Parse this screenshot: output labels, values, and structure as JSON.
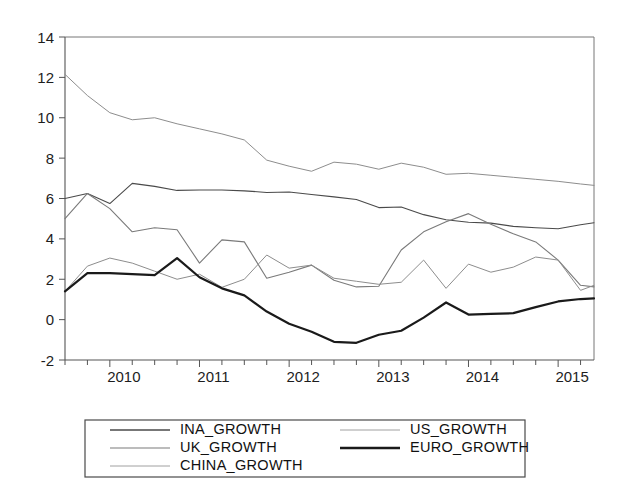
{
  "chart_data": {
    "type": "line",
    "title": "",
    "subtitle": "",
    "xlabel": "",
    "ylabel": "",
    "xlim": [
      2009.5,
      2015.4
    ],
    "ylim": [
      -2,
      14
    ],
    "y_ticks": [
      -2,
      0,
      2,
      4,
      6,
      8,
      10,
      12,
      14
    ],
    "y_tick_labels": [
      "-2",
      "0",
      "2",
      "4",
      "6",
      "8",
      "10",
      "12",
      "14"
    ],
    "x_ticks": [
      2010,
      2011,
      2012,
      2013,
      2014,
      2015
    ],
    "x_tick_labels": [
      "2010",
      "2011",
      "2012",
      "2013",
      "2014",
      "2015"
    ],
    "x_minor_tick_interval": 0.25,
    "grid": false,
    "legend_position": "bottom-center",
    "legend_columns": 2,
    "x": [
      2009.5,
      2009.75,
      2010.0,
      2010.25,
      2010.5,
      2010.75,
      2011.0,
      2011.25,
      2011.5,
      2011.75,
      2012.0,
      2012.25,
      2012.5,
      2012.75,
      2013.0,
      2013.25,
      2013.5,
      2013.75,
      2014.0,
      2014.25,
      2014.5,
      2014.75,
      2015.0,
      2015.25,
      2015.4
    ],
    "series": [
      {
        "name": "INA_GROWTH",
        "color": "#4a4a4a",
        "width": 1.1,
        "values": [
          6.0,
          6.25,
          5.75,
          6.75,
          6.6,
          6.4,
          6.42,
          6.42,
          6.38,
          6.3,
          6.32,
          6.2,
          6.08,
          5.95,
          5.55,
          5.58,
          5.2,
          4.95,
          4.82,
          4.78,
          4.62,
          4.55,
          4.5,
          4.7,
          4.8
        ]
      },
      {
        "name": "UK_GROWTH",
        "color": "#7a7a7a",
        "width": 1.1,
        "values": [
          5.0,
          6.25,
          5.5,
          4.35,
          4.55,
          4.45,
          2.8,
          3.95,
          3.85,
          2.05,
          2.35,
          2.7,
          1.95,
          1.62,
          1.65,
          3.45,
          4.35,
          4.85,
          5.25,
          4.72,
          4.25,
          3.85,
          2.95,
          1.7,
          1.62
        ]
      },
      {
        "name": "CHINA_GROWTH",
        "color": "#8d8d8d",
        "width": 1.0,
        "values": [
          12.15,
          11.1,
          10.25,
          9.9,
          10.0,
          9.7,
          9.45,
          9.2,
          8.9,
          7.9,
          7.6,
          7.35,
          7.8,
          7.7,
          7.45,
          7.75,
          7.55,
          7.2,
          7.25,
          7.15,
          7.05,
          6.95,
          6.85,
          6.72,
          6.65
        ]
      },
      {
        "name": "US_GROWTH",
        "color": "#8d8d8d",
        "width": 1.0,
        "values": [
          1.4,
          2.65,
          3.05,
          2.8,
          2.4,
          2.0,
          2.25,
          1.6,
          2.0,
          3.2,
          2.55,
          2.7,
          2.05,
          1.9,
          1.75,
          1.85,
          2.95,
          1.55,
          2.75,
          2.35,
          2.6,
          3.1,
          2.95,
          1.45,
          1.7
        ]
      },
      {
        "name": "EURO_GROWTH",
        "color": "#1a1a1a",
        "width": 2.2,
        "values": [
          1.4,
          2.3,
          2.3,
          2.25,
          2.2,
          3.05,
          2.1,
          1.55,
          1.2,
          0.4,
          -0.2,
          -0.6,
          -1.1,
          -1.15,
          -0.75,
          -0.55,
          0.1,
          0.85,
          0.25,
          0.28,
          0.32,
          0.62,
          0.9,
          1.02,
          1.05
        ]
      }
    ]
  },
  "legend": {
    "entries": [
      {
        "label": "INA_GROWTH",
        "color": "#4a4a4a",
        "width": 1.4,
        "column": 0,
        "row": 0
      },
      {
        "label": "UK_GROWTH",
        "color": "#7a7a7a",
        "width": 1.2,
        "column": 0,
        "row": 1
      },
      {
        "label": "CHINA_GROWTH",
        "color": "#a0a0a0",
        "width": 1.0,
        "column": 0,
        "row": 2
      },
      {
        "label": "US_GROWTH",
        "color": "#a0a0a0",
        "width": 1.0,
        "column": 1,
        "row": 0
      },
      {
        "label": "EURO_GROWTH",
        "color": "#1a1a1a",
        "width": 2.4,
        "column": 1,
        "row": 1
      }
    ]
  },
  "layout": {
    "plot_left": 65,
    "plot_right": 594,
    "plot_top": 37,
    "plot_bottom": 360,
    "legend_left": 85,
    "legend_top": 420,
    "legend_width": 440,
    "legend_height": 57
  }
}
